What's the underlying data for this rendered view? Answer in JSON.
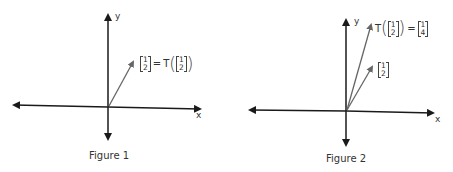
{
  "figures": [
    {
      "caption": "Figure 1",
      "axis_x_label": "x",
      "axis_y_label": "y",
      "label": {
        "left_matrix": [
          "1",
          "2"
        ],
        "equals": "=",
        "func": "T",
        "arg_matrix": [
          "1",
          "2"
        ]
      }
    },
    {
      "caption": "Figure 2",
      "axis_x_label": "x",
      "axis_y_label": "y",
      "image_label": {
        "func": "T",
        "arg_matrix": [
          "1",
          "2"
        ],
        "equals": "=",
        "result_matrix": [
          "1",
          "4"
        ]
      },
      "vector_label": [
        "1",
        "2"
      ]
    }
  ],
  "colors": {
    "axis": "#1a1a1a",
    "vector": "#666666"
  }
}
